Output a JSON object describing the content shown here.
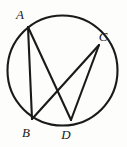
{
  "figure": {
    "type": "circle-geometry-diagram",
    "background_color": "#fdfdfc",
    "stroke_color": "#1a1a1a",
    "circle": {
      "name": "circumscribed-circle",
      "center_x": 62.5,
      "center_y": 70.5,
      "radius": 55.0
    },
    "points": [
      {
        "id": "A",
        "label": "A",
        "x": 28.0,
        "y": 27.0,
        "label_x": 20.0,
        "label_y": 19.0
      },
      {
        "id": "C",
        "label": "C",
        "x": 99.0,
        "y": 45.0,
        "label_x": 103.0,
        "label_y": 41.0
      },
      {
        "id": "B",
        "label": "B",
        "x": 32.0,
        "y": 119.0,
        "label_x": 26.0,
        "label_y": 137.0
      },
      {
        "id": "D",
        "label": "D",
        "x": 71.0,
        "y": 120.0,
        "label_x": 66.0,
        "label_y": 139.0
      }
    ],
    "chords": [
      {
        "id": "AB",
        "name": "chord-a-b",
        "from": "A",
        "to": "B",
        "x1": 28.0,
        "y1": 27.0,
        "x2": 32.0,
        "y2": 119.0
      },
      {
        "id": "AD",
        "name": "chord-a-d",
        "from": "A",
        "to": "D",
        "x1": 28.0,
        "y1": 27.0,
        "x2": 71.0,
        "y2": 120.0
      },
      {
        "id": "BC",
        "name": "chord-b-c",
        "from": "B",
        "to": "C",
        "x1": 32.0,
        "y1": 119.0,
        "x2": 99.0,
        "y2": 45.0
      },
      {
        "id": "CD",
        "name": "chord-c-d",
        "from": "C",
        "to": "D",
        "x1": 99.0,
        "y1": 45.0,
        "x2": 71.0,
        "y2": 120.0
      }
    ]
  }
}
